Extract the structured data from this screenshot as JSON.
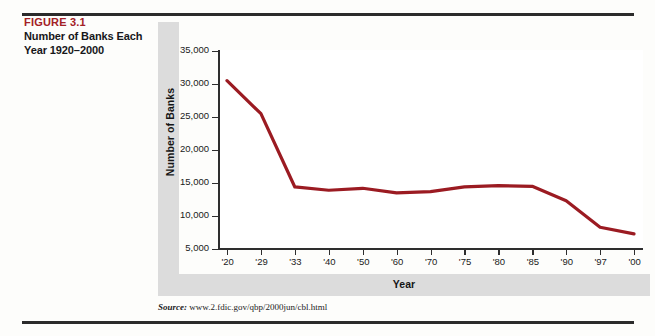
{
  "figure": {
    "number_label": "FIGURE 3.1",
    "title": "Number of Banks Each Year 1920–2000",
    "source_label": "Source:",
    "source_url": "www.2.fdic.gov/qbp/2000jun/cbl.html",
    "accent_color": "#a32126",
    "line_color": "#9b1b22",
    "band_color": "#dcdcdc"
  },
  "chart_data": {
    "type": "line",
    "title": "Number of Banks Each Year 1920–2000",
    "xlabel": "Year",
    "ylabel": "Number of Banks",
    "categories": [
      "'20",
      "'29",
      "'33",
      "'40",
      "'50",
      "'60",
      "'70",
      "'75",
      "'80",
      "'85",
      "'90",
      "'97",
      "'00"
    ],
    "values": [
      30500,
      25500,
      14400,
      13900,
      14200,
      13500,
      13700,
      14400,
      14600,
      14500,
      12300,
      8300,
      7300
    ],
    "ylim": [
      5000,
      35000
    ],
    "ytick_labels": [
      "35,000",
      "30,000",
      "25,000",
      "20,000",
      "15,000",
      "10,000",
      "5,000"
    ],
    "ytick_values": [
      35000,
      30000,
      25000,
      20000,
      15000,
      10000,
      5000
    ],
    "grid": false,
    "legend": "none",
    "series_color": "#9b1b22"
  }
}
